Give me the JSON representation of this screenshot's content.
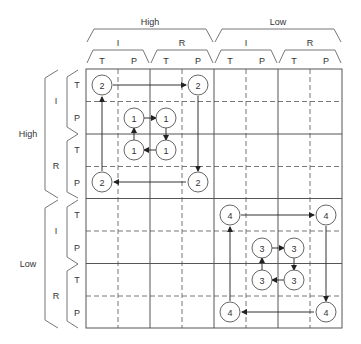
{
  "columns": {
    "level1": [
      {
        "label": "High"
      },
      {
        "label": "Low"
      }
    ],
    "level2": [
      {
        "label": "I"
      },
      {
        "label": "R"
      },
      {
        "label": "I"
      },
      {
        "label": "R"
      }
    ],
    "level3": [
      {
        "label": "T"
      },
      {
        "label": "P"
      },
      {
        "label": "T"
      },
      {
        "label": "P"
      },
      {
        "label": "T"
      },
      {
        "label": "P"
      },
      {
        "label": "T"
      },
      {
        "label": "P"
      }
    ]
  },
  "rows": {
    "level1": [
      {
        "label": "High"
      },
      {
        "label": "Low"
      }
    ],
    "level2": [
      {
        "label": "I"
      },
      {
        "label": "R"
      },
      {
        "label": "I"
      },
      {
        "label": "R"
      }
    ],
    "level3": [
      {
        "label": "T"
      },
      {
        "label": "P"
      },
      {
        "label": "T"
      },
      {
        "label": "P"
      },
      {
        "label": "T"
      },
      {
        "label": "P"
      },
      {
        "label": "T"
      },
      {
        "label": "P"
      }
    ]
  },
  "nodes": [
    {
      "label": "2",
      "col": 0,
      "row": 0
    },
    {
      "label": "2",
      "col": 3,
      "row": 0
    },
    {
      "label": "2",
      "col": 3,
      "row": 3
    },
    {
      "label": "2",
      "col": 0,
      "row": 3
    },
    {
      "label": "1",
      "col": 1,
      "row": 1
    },
    {
      "label": "1",
      "col": 2,
      "row": 1
    },
    {
      "label": "1",
      "col": 2,
      "row": 2
    },
    {
      "label": "1",
      "col": 1,
      "row": 2
    },
    {
      "label": "4",
      "col": 4,
      "row": 4
    },
    {
      "label": "4",
      "col": 7,
      "row": 4
    },
    {
      "label": "4",
      "col": 7,
      "row": 7
    },
    {
      "label": "4",
      "col": 4,
      "row": 7
    },
    {
      "label": "3",
      "col": 5,
      "row": 5
    },
    {
      "label": "3",
      "col": 6,
      "row": 5
    },
    {
      "label": "3",
      "col": 6,
      "row": 6
    },
    {
      "label": "3",
      "col": 5,
      "row": 6
    }
  ]
}
